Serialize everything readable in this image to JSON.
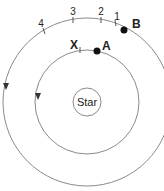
{
  "diagram": {
    "center": {
      "x": 87,
      "y": 102
    },
    "star": {
      "label": "Star",
      "radius": 14
    },
    "inner_orbit": {
      "radius": 52,
      "planet_label": "A",
      "marker_label": "X"
    },
    "outer_orbit": {
      "radius": 84,
      "planet_label": "B",
      "tick_labels": [
        "1",
        "2",
        "3",
        "4"
      ]
    },
    "colors": {
      "line": "#8a8a8a",
      "dot": "#111111",
      "text": "#222222"
    }
  }
}
